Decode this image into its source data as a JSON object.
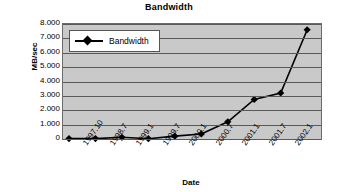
{
  "chart_data": {
    "type": "line",
    "title": "Bandwidth",
    "xlabel": "Date",
    "ylabel": "MB/sec",
    "grid": true,
    "legend_position": "upper-left-inside",
    "categories": [
      "1997.10",
      "1998.7",
      "1999.1",
      "1999.7",
      "2000.1",
      "2000.7",
      "2001.1",
      "2001.7",
      "2002.1"
    ],
    "x_tick_labels": [
      "1997.10",
      "1998.7",
      "1999.1",
      "1999.7",
      "2000.1",
      "2000.7",
      "2001.1",
      "2001.7",
      "2002.1"
    ],
    "y_tick_labels": [
      "8.000",
      "7.000",
      "6.000",
      "5.000",
      "4.000",
      "3.000",
      "2.000",
      "1.000",
      "0"
    ],
    "ylim": [
      0,
      8
    ],
    "y_major_step": 1,
    "series": [
      {
        "name": "Bandwidth",
        "marker": "diamond",
        "color": "#000000",
        "values": [
          0.03,
          0.12,
          0.02,
          0.2,
          0.35,
          1.2,
          2.75,
          3.2,
          7.6
        ]
      }
    ],
    "point_count": 10,
    "all_point_values": [
      0.03,
      0.12,
      0.02,
      0.2,
      0.35,
      1.2,
      2.75,
      3.2,
      7.6
    ],
    "colors": {
      "plot_background": "#c9c9c9",
      "gridline": "#595959",
      "series_line": "#000000",
      "legend_background": "#ffffff",
      "page_background": "#ffffff"
    }
  },
  "legend": {
    "entries": [
      {
        "label": "Bandwidth",
        "marker_icon": "diamond-marker-icon"
      }
    ]
  }
}
